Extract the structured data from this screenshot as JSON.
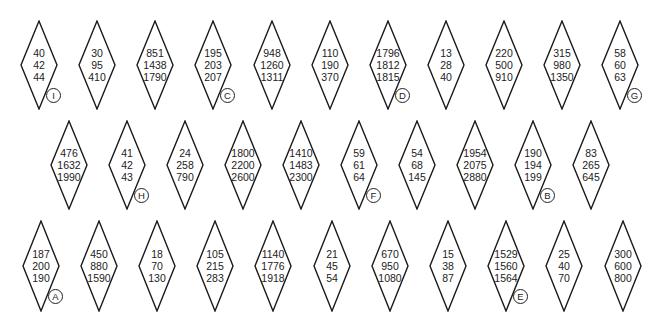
{
  "rows": [
    {
      "top": 20,
      "height": 90,
      "items": [
        {
          "cx": 39,
          "values": [
            "40",
            "42",
            "44"
          ],
          "label": "I"
        },
        {
          "cx": 97,
          "values": [
            "30",
            "95",
            "410"
          ]
        },
        {
          "cx": 155,
          "values": [
            "851",
            "1438",
            "1790"
          ]
        },
        {
          "cx": 213,
          "values": [
            "195",
            "203",
            "207"
          ],
          "label": "C"
        },
        {
          "cx": 272,
          "values": [
            "948",
            "1260",
            "1311"
          ]
        },
        {
          "cx": 330,
          "values": [
            "110",
            "190",
            "370"
          ]
        },
        {
          "cx": 388,
          "values": [
            "1796",
            "1812",
            "1815"
          ],
          "label": "D"
        },
        {
          "cx": 446,
          "values": [
            "13",
            "28",
            "40"
          ]
        },
        {
          "cx": 504,
          "values": [
            "220",
            "500",
            "910"
          ]
        },
        {
          "cx": 562,
          "values": [
            "315",
            "980",
            "1350"
          ]
        },
        {
          "cx": 620,
          "values": [
            "58",
            "60",
            "63"
          ],
          "label": "G"
        }
      ]
    },
    {
      "top": 120,
      "height": 90,
      "items": [
        {
          "cx": 69,
          "values": [
            "476",
            "1632",
            "1990"
          ]
        },
        {
          "cx": 127,
          "values": [
            "41",
            "42",
            "43"
          ],
          "label": "H"
        },
        {
          "cx": 185,
          "values": [
            "24",
            "258",
            "790"
          ]
        },
        {
          "cx": 243,
          "values": [
            "1800",
            "2200",
            "2600"
          ]
        },
        {
          "cx": 301,
          "values": [
            "1410",
            "1483",
            "2300"
          ]
        },
        {
          "cx": 359,
          "values": [
            "59",
            "61",
            "64"
          ],
          "label": "F"
        },
        {
          "cx": 417,
          "values": [
            "54",
            "68",
            "145"
          ]
        },
        {
          "cx": 475,
          "values": [
            "1954",
            "2075",
            "2880"
          ]
        },
        {
          "cx": 533,
          "values": [
            "190",
            "194",
            "199"
          ],
          "label": "B"
        },
        {
          "cx": 591,
          "values": [
            "83",
            "265",
            "645"
          ]
        }
      ]
    },
    {
      "top": 220,
      "height": 92,
      "items": [
        {
          "cx": 41,
          "values": [
            "187",
            "200",
            "190"
          ],
          "label": "A"
        },
        {
          "cx": 99,
          "values": [
            "450",
            "880",
            "1590"
          ]
        },
        {
          "cx": 157,
          "values": [
            "18",
            "70",
            "130"
          ]
        },
        {
          "cx": 215,
          "values": [
            "105",
            "215",
            "283"
          ]
        },
        {
          "cx": 273,
          "values": [
            "1140",
            "1776",
            "1918"
          ]
        },
        {
          "cx": 332,
          "values": [
            "21",
            "45",
            "54"
          ]
        },
        {
          "cx": 390,
          "values": [
            "670",
            "950",
            "1080"
          ]
        },
        {
          "cx": 448,
          "values": [
            "15",
            "38",
            "87"
          ]
        },
        {
          "cx": 506,
          "values": [
            "1529",
            "1560",
            "1564"
          ],
          "label": "E"
        },
        {
          "cx": 564,
          "values": [
            "25",
            "40",
            "70"
          ]
        },
        {
          "cx": 623,
          "values": [
            "300",
            "600",
            "800"
          ]
        }
      ]
    }
  ],
  "colors": {
    "stroke": "#1a1a1a",
    "text": "#222222",
    "background": "#ffffff"
  }
}
